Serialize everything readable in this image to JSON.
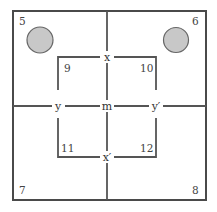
{
  "diagram": {
    "type": "square grid with inner square and labeled midpoints",
    "colors": {
      "line": "#4a4a4a",
      "circle_fill": "#c8c8c8",
      "circle_stroke": "#666666",
      "text": "#333333",
      "background": "#ffffff"
    },
    "outer_square": {
      "x1": 13,
      "y1": 11,
      "x2": 206,
      "y2": 200
    },
    "center": {
      "x": 107,
      "y": 106
    },
    "inner_square": {
      "x1": 58,
      "y1": 57,
      "x2": 156,
      "y2": 157
    },
    "corner_labels": {
      "top_left": "5",
      "top_right": "6",
      "bottom_left": "7",
      "bottom_right": "8"
    },
    "inner_labels": {
      "top_left": "9",
      "top_right": "10",
      "bottom_left": "11",
      "bottom_right": "12"
    },
    "point_labels": {
      "top": "x",
      "bottom": "x′",
      "left": "y",
      "right": "y′",
      "center": "m"
    },
    "circles": [
      {
        "name": "top-left-circle",
        "cx": 40,
        "cy": 40,
        "r": 13
      },
      {
        "name": "top-right-circle",
        "cx": 176,
        "cy": 40,
        "r": 12.5
      }
    ]
  }
}
